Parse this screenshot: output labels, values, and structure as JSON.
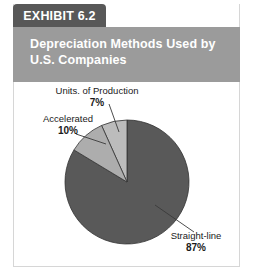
{
  "exhibit": {
    "tab_label": "EXHIBIT 6.2",
    "title": "Depreciation Methods Used by U.S. Companies",
    "title_line1": "Depreciation Methods Used by",
    "title_line2": "U.S. Companies"
  },
  "colors": {
    "tab_background": "#585858",
    "title_background": "#9b9b9b",
    "title_text": "#ffffff",
    "slice_dark": "#595959",
    "slice_light": "#bcbcbc",
    "slice_mid": "#adadad",
    "outline": "#333333",
    "frame_border": "#d6d6d6",
    "label_text": "#1a1a1a"
  },
  "labels": {
    "units": {
      "name": "Units. of Production",
      "value": "7%"
    },
    "accelerated": {
      "name": "Accelerated",
      "value": "10%"
    },
    "straightline": {
      "name": "Straight-line",
      "value": "87%"
    }
  },
  "chart_data": {
    "type": "pie",
    "title": "Depreciation Methods Used by U.S. Companies",
    "xlabel": "",
    "ylabel": "",
    "legend": "none",
    "grid": false,
    "unit": "percent",
    "start_angle_deg": 90,
    "direction": "clockwise",
    "categories": [
      "Straight-line",
      "Units. of Production",
      "Accelerated"
    ],
    "values": [
      87,
      7,
      10
    ],
    "slices": [
      {
        "label": "Straight-line",
        "value": 87,
        "display": "87%",
        "color": "#595959"
      },
      {
        "label": "Units. of Production",
        "value": 7,
        "display": "7%",
        "color": "#bcbcbc"
      },
      {
        "label": "Accelerated",
        "value": 10,
        "display": "10%",
        "color": "#adadad"
      }
    ]
  }
}
